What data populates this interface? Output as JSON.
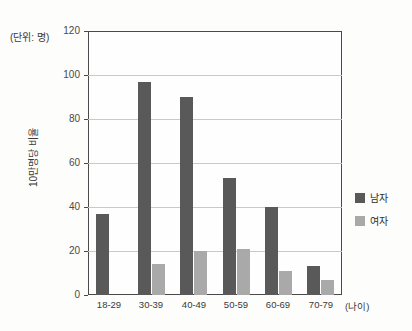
{
  "unit_caption": "(단위: 명)",
  "y_axis_title": "10만명당 비율",
  "x_axis_unit": "(나이)",
  "legend": {
    "items": [
      {
        "label": "남자",
        "color": "#595959"
      },
      {
        "label": "여자",
        "color": "#a9a9a9"
      }
    ]
  },
  "colors": {
    "male": "#595959",
    "female": "#a9a9a9",
    "gridline": "#c9c9c9",
    "axis": "#4a4a4a",
    "background": "#fdfdfb"
  },
  "chart_data": {
    "type": "bar",
    "title": "",
    "subtitle": "",
    "xlabel": "(나이)",
    "ylabel": "10만명당 비율",
    "unit_note": "(단위: 명)",
    "categories": [
      "18-29",
      "30-39",
      "40-49",
      "50-59",
      "60-69",
      "70-79"
    ],
    "series": [
      {
        "name": "남자",
        "color": "#595959",
        "values": [
          37,
          97,
          90,
          53,
          40,
          13
        ]
      },
      {
        "name": "여자",
        "color": "#a9a9a9",
        "values": [
          0,
          14,
          20,
          21,
          11,
          7
        ]
      }
    ],
    "ylim": [
      0,
      120
    ],
    "yticks": [
      0,
      20,
      40,
      60,
      80,
      100,
      120
    ],
    "ytick_labels": [
      "0",
      "20",
      "40",
      "60",
      "80",
      "100",
      "120"
    ],
    "grid": true,
    "grid_axis": "y",
    "legend_position": "right"
  }
}
